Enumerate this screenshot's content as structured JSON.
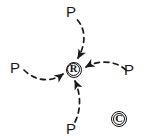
{
  "diagram": {
    "background_color": "#ffffff",
    "ink_color": "#1a1a1a",
    "style": "hand-drawn sketch, dashed curved arrows",
    "center_node": {
      "symbol": "R",
      "icon_name": "circled-r-registered-symbol",
      "x": 73.5,
      "y": 69.5,
      "radius": 8
    },
    "corner_mark": {
      "symbol": "C",
      "icon_name": "circled-c-copyright-symbol",
      "x": 119,
      "y": 119,
      "radius": 8
    },
    "labels": [
      {
        "text": "P",
        "position": "top",
        "x": 71,
        "y": 11
      },
      {
        "text": "P",
        "position": "left",
        "x": 15,
        "y": 67
      },
      {
        "text": "P",
        "position": "right",
        "x": 129,
        "y": 69
      },
      {
        "text": "P",
        "position": "bottom",
        "x": 71,
        "y": 128
      }
    ],
    "arrows": [
      {
        "name": "arrow-top-to-center",
        "from": "P (top)",
        "to": "R",
        "direction": "down",
        "stroke": "dashed",
        "curve": "convex-right"
      },
      {
        "name": "arrow-left-to-center",
        "from": "P (left)",
        "to": "R",
        "direction": "right",
        "stroke": "dashed",
        "curve": "convex-down"
      },
      {
        "name": "arrow-right-to-center",
        "from": "P (right)",
        "to": "R",
        "direction": "left",
        "stroke": "dashed",
        "curve": "convex-up"
      },
      {
        "name": "arrow-bottom-to-center",
        "from": "P (bottom)",
        "to": "R",
        "direction": "up",
        "stroke": "dashed",
        "curve": "convex-right"
      }
    ]
  }
}
